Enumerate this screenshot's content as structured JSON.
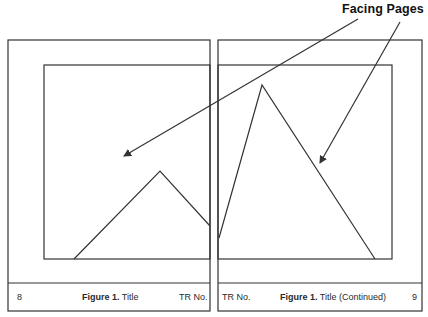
{
  "callout": {
    "label": "Facing Pages"
  },
  "left_page": {
    "page_number": "8",
    "figure_label": "Figure 1.",
    "figure_title": "Title",
    "report_id": "TR No."
  },
  "right_page": {
    "report_id": "TR No.",
    "figure_label": "Figure 1.",
    "figure_title": "Title (Continued)",
    "page_number": "9"
  },
  "colors": {
    "line": "#333333",
    "background": "#ffffff"
  }
}
